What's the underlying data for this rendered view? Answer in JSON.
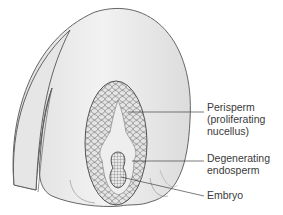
{
  "diagram": {
    "labels": [
      {
        "id": "perisperm",
        "lines": [
          "Perisperm",
          "(proliferating",
          "nucellus)"
        ]
      },
      {
        "id": "endosperm",
        "lines": [
          "Degenerating",
          "endosperm"
        ]
      },
      {
        "id": "embryo",
        "lines": [
          "Embryo"
        ]
      }
    ],
    "colors": {
      "fill": "#ececec",
      "stroke": "#555555",
      "cells": "#6a6a6a",
      "text": "#3a3a3a"
    }
  }
}
